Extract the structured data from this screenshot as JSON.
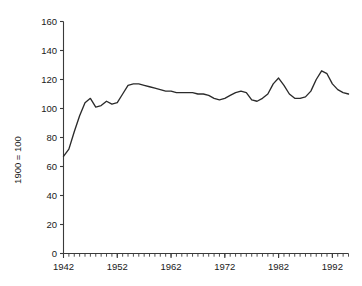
{
  "chart_data": {
    "type": "line",
    "title": "",
    "subtitle": "",
    "xlabel": "",
    "ylabel": "1900 = 100",
    "xlim": [
      1942,
      1995
    ],
    "ylim": [
      0,
      160
    ],
    "grid": false,
    "legend": false,
    "legend_position": "none",
    "x_major_ticks": [
      1942,
      1952,
      1962,
      1972,
      1982,
      1992
    ],
    "x_tick_labels": [
      "1942",
      "1952",
      "1962",
      "1972",
      "1982",
      "1992"
    ],
    "x_minor_tick_step": 1,
    "y_ticks": [
      0,
      20,
      40,
      60,
      80,
      100,
      120,
      140,
      160
    ],
    "y_tick_labels": [
      "0",
      "20",
      "40",
      "60",
      "80",
      "100",
      "120",
      "140",
      "160"
    ],
    "line_color": "#2b2b2b",
    "x": [
      1942,
      1943,
      1944,
      1945,
      1946,
      1947,
      1948,
      1949,
      1950,
      1951,
      1952,
      1953,
      1954,
      1955,
      1956,
      1957,
      1958,
      1959,
      1960,
      1961,
      1962,
      1963,
      1964,
      1965,
      1966,
      1967,
      1968,
      1969,
      1970,
      1971,
      1972,
      1973,
      1974,
      1975,
      1976,
      1977,
      1978,
      1979,
      1980,
      1981,
      1982,
      1983,
      1984,
      1985,
      1986,
      1987,
      1988,
      1989,
      1990,
      1991,
      1992,
      1993,
      1994,
      1995
    ],
    "series": [
      {
        "name": "Index (1900 = 100)",
        "values": [
          67,
          72,
          84,
          95,
          104,
          107,
          101,
          102,
          105,
          103,
          104,
          110,
          116,
          117,
          117,
          116,
          115,
          114,
          113,
          112,
          112,
          111,
          111,
          111,
          111,
          110,
          110,
          109,
          107,
          106,
          107,
          109,
          111,
          112,
          111,
          106,
          105,
          107,
          110,
          117,
          121,
          116,
          110,
          107,
          107,
          108,
          112,
          120,
          126,
          124,
          117,
          113,
          111,
          110
        ]
      }
    ],
    "annotations": []
  },
  "axis": {
    "y_title": "1900 = 100"
  }
}
